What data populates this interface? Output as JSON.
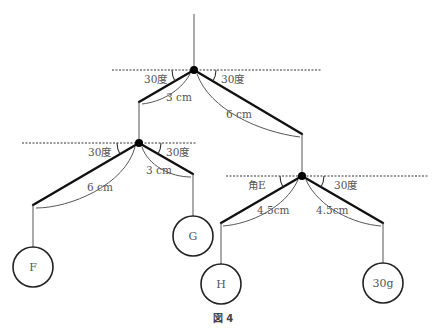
{
  "figure": {
    "caption": "図 4",
    "top_lever": {
      "left_angle": "30度",
      "right_angle": "30度",
      "left_length": "3 cm",
      "right_length": "6 cm"
    },
    "left_lever": {
      "left_angle": "30度",
      "right_angle": "30度",
      "left_length": "6 cm",
      "right_length": "3 cm"
    },
    "right_lever": {
      "left_angle": "角E",
      "right_angle": "30度",
      "left_length": "4.5cm",
      "right_length": "4.5cm"
    },
    "weights": {
      "F": "F",
      "G": "G",
      "H": "H",
      "right": "30g"
    }
  }
}
